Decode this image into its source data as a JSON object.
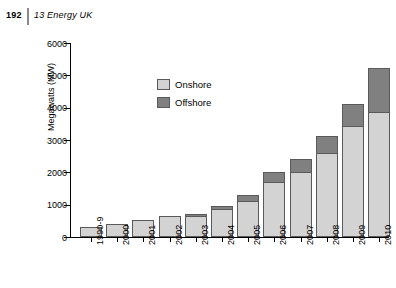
{
  "header": {
    "folio": "192",
    "chapter": "13  Energy UK"
  },
  "chart_data": {
    "type": "bar",
    "stacked": true,
    "title": "",
    "xlabel": "",
    "ylabel": "Megawatts (MW)",
    "ylim": [
      0,
      6000
    ],
    "yticks": [
      0,
      1000,
      2000,
      3000,
      4000,
      5000,
      6000
    ],
    "ytick_labels": [
      "0",
      "1000",
      "2000",
      "3000",
      "4000",
      "5000",
      "6000"
    ],
    "grid": false,
    "legend_position": "inside-upper-left",
    "categories": [
      "1990-9",
      "2000",
      "2001",
      "2002",
      "2003",
      "2004",
      "2005",
      "2006",
      "2007",
      "2008",
      "2009",
      "2010"
    ],
    "series": [
      {
        "name": "Onshore",
        "color": "#d3d3d3",
        "values": [
          310,
          415,
          520,
          635,
          650,
          855,
          1100,
          1700,
          2000,
          2600,
          3420,
          3870
        ]
      },
      {
        "name": "Offshore",
        "color": "#808080",
        "values": [
          0,
          0,
          0,
          0,
          50,
          105,
          205,
          305,
          410,
          530,
          690,
          1350
        ]
      }
    ],
    "totals": [
      310,
      415,
      520,
      635,
      700,
      960,
      1305,
      2005,
      2410,
      3130,
      4110,
      5220
    ]
  }
}
